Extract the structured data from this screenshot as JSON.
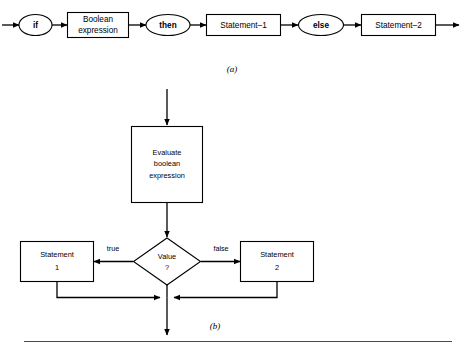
{
  "figure": {
    "background_color": "#ffffff",
    "line_color": "#000000",
    "captions": {
      "a": "(a)",
      "b": "(b)"
    }
  },
  "syntax_diagram": {
    "nodes": [
      {
        "id": "if",
        "label": "if",
        "shape": "ellipse",
        "bold": true
      },
      {
        "id": "boolean-expression",
        "label_line1": "Boolean",
        "label_line2": "expression",
        "shape": "rect",
        "bold": false
      },
      {
        "id": "then",
        "label": "then",
        "shape": "ellipse",
        "bold": true
      },
      {
        "id": "statement-1",
        "label": "Statement–1",
        "shape": "rect",
        "bold": false
      },
      {
        "id": "else",
        "label": "else",
        "shape": "ellipse",
        "bold": true
      },
      {
        "id": "statement-2",
        "label": "Statement–2",
        "shape": "rect",
        "bold": false
      }
    ]
  },
  "flowchart": {
    "process": {
      "id": "evaluate-boolean-expression",
      "label_line1": "Evaluate",
      "label_line2": "boolean",
      "label_line3": "expression"
    },
    "decision": {
      "id": "value-decision",
      "label_line1": "Value",
      "label_line2": "?"
    },
    "edge_labels": {
      "true": "true",
      "false": "false"
    },
    "branches": [
      {
        "id": "statement-1-box",
        "label_line1": "Statement",
        "label_line2": "1"
      },
      {
        "id": "statement-2-box",
        "label_line1": "Statement",
        "label_line2": "2"
      }
    ]
  }
}
